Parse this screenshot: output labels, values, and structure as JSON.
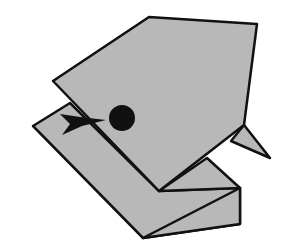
{
  "diagram": {
    "colors": {
      "background": "#ffffff",
      "paper": "#b8b8b8",
      "outline": "#111111",
      "eye": "#111111",
      "arrow": "#111111"
    },
    "elements": [
      "lower-fold",
      "head-flap",
      "beak",
      "eye",
      "fold-arrow"
    ]
  }
}
